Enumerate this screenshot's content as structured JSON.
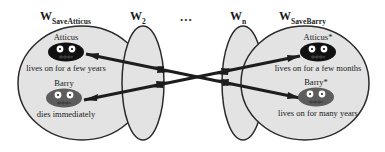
{
  "figure": {
    "background_color": "#ffffff",
    "ellipse_fill": "#e2e2e2",
    "ellipse_stroke": "#2b2b2b",
    "arrow_color": "#1d1d1d",
    "creature_dark_color": "#111111",
    "creature_gray_color": "#5d5d5d"
  },
  "worlds": [
    {
      "id": "world-save-atticus",
      "label_main": "W",
      "label_sub": "SaveAtticus",
      "occupants": [
        {
          "id": "atticus-left",
          "name": "Atticus",
          "fate": "lives on for a few years",
          "shade": "dark"
        },
        {
          "id": "barry-left",
          "name": "Barry",
          "fate": "dies immediately",
          "shade": "gray"
        }
      ]
    },
    {
      "id": "world-2",
      "label_main": "W",
      "label_sub": "2",
      "occupants": []
    },
    {
      "id": "world-n",
      "label_main": "W",
      "label_sub": "n",
      "occupants": []
    },
    {
      "id": "world-save-barry",
      "label_main": "W",
      "label_sub": "SaveBarry",
      "occupants": [
        {
          "id": "atticus-right",
          "name": "Atticus*",
          "fate": "lives on for a few months",
          "shade": "dark"
        },
        {
          "id": "barry-right",
          "name": "Barry*",
          "fate": "lives on for many years",
          "shade": "gray"
        }
      ]
    }
  ],
  "ellipsis": "...",
  "relations": [
    {
      "id": "relation-atticus-to-barry-star",
      "from": "atticus-left",
      "to": "barry-right",
      "style": "double-headed"
    },
    {
      "id": "relation-barry-to-atticus-star",
      "from": "barry-left",
      "to": "atticus-right",
      "style": "double-headed"
    }
  ]
}
